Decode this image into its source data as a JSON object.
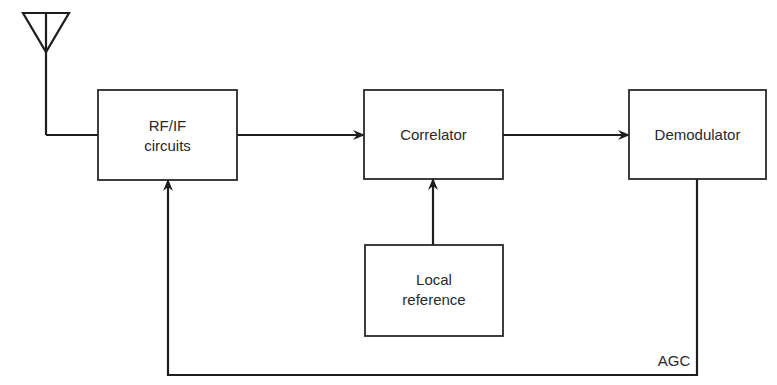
{
  "diagram": {
    "type": "block-diagram",
    "blocks": {
      "rf_if": {
        "line1": "RF/IF",
        "line2": "circuits"
      },
      "correlator": {
        "label": "Correlator"
      },
      "demodulator": {
        "label": "Demodulator"
      },
      "local_reference": {
        "line1": "Local",
        "line2": "reference"
      }
    },
    "labels": {
      "agc": "AGC"
    },
    "connections": [
      {
        "from": "antenna",
        "to": "rf_if"
      },
      {
        "from": "rf_if",
        "to": "correlator"
      },
      {
        "from": "correlator",
        "to": "demodulator"
      },
      {
        "from": "local_reference",
        "to": "correlator"
      },
      {
        "from": "demodulator",
        "to": "rf_if",
        "label": "AGC"
      }
    ]
  }
}
